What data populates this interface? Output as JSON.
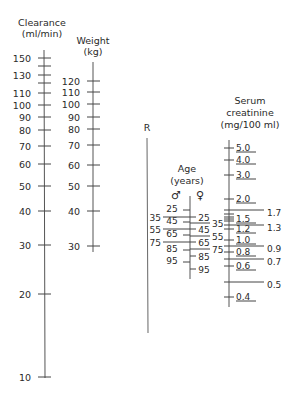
{
  "scales": {
    "clearance": {
      "title_line1": "Clearance",
      "title_line2": "(ml/min)",
      "labels": [
        {
          "v": "150",
          "y": 58
        },
        {
          "v": "130",
          "y": 75
        },
        {
          "v": "110",
          "y": 93
        },
        {
          "v": "100",
          "y": 105
        },
        {
          "v": "90",
          "y": 117
        },
        {
          "v": "80",
          "y": 130
        },
        {
          "v": "70",
          "y": 146
        },
        {
          "v": "60",
          "y": 164
        },
        {
          "v": "50",
          "y": 186
        },
        {
          "v": "40",
          "y": 211
        },
        {
          "v": "30",
          "y": 245
        },
        {
          "v": "20",
          "y": 294
        },
        {
          "v": "10",
          "y": 377
        }
      ],
      "minor_ticks_y": [
        66,
        83
      ]
    },
    "weight": {
      "title_line1": "Weight",
      "title_line2": "(kg)",
      "labels": [
        {
          "v": "120",
          "y": 81
        },
        {
          "v": "110",
          "y": 92
        },
        {
          "v": "100",
          "y": 104
        },
        {
          "v": "90",
          "y": 117
        },
        {
          "v": "80",
          "y": 129
        },
        {
          "v": "70",
          "y": 145
        },
        {
          "v": "60",
          "y": 165
        },
        {
          "v": "50",
          "y": 186
        },
        {
          "v": "40",
          "y": 211
        },
        {
          "v": "30",
          "y": 246
        }
      ]
    },
    "r_line": {
      "label": "R"
    },
    "age": {
      "title_line1": "Age",
      "title_line2": "(years)",
      "male_symbol": "♂",
      "female_symbol": "♀",
      "male_inner": [
        {
          "v": "25",
          "y": 210
        },
        {
          "v": "45",
          "y": 222
        },
        {
          "v": "65",
          "y": 235
        },
        {
          "v": "85",
          "y": 250
        },
        {
          "v": "95",
          "y": 262
        }
      ],
      "male_outer": [
        {
          "v": "35",
          "y": 217
        },
        {
          "v": "55",
          "y": 229
        },
        {
          "v": "75",
          "y": 242
        }
      ],
      "female_inner": [
        {
          "v": "25",
          "y": 217
        },
        {
          "v": "45",
          "y": 229
        },
        {
          "v": "65",
          "y": 242
        },
        {
          "v": "85",
          "y": 256
        },
        {
          "v": "95",
          "y": 269
        }
      ],
      "female_outer": [
        {
          "v": "35",
          "y": 223
        },
        {
          "v": "55",
          "y": 236
        },
        {
          "v": "75",
          "y": 249
        }
      ]
    },
    "creatinine": {
      "title_line1": "Serum",
      "title_line2": "creatinine",
      "title_line3": "(mg/100 ml)",
      "left_labels": [
        {
          "v": "5.0",
          "y": 148
        },
        {
          "v": "4.0",
          "y": 160
        },
        {
          "v": "3.0",
          "y": 175
        },
        {
          "v": "2.0",
          "y": 199
        },
        {
          "v": "1.5",
          "y": 219
        },
        {
          "v": "1.2",
          "y": 229
        },
        {
          "v": "1.0",
          "y": 240
        },
        {
          "v": "0.8",
          "y": 252
        },
        {
          "v": "0.6",
          "y": 266
        },
        {
          "v": "0.4",
          "y": 297
        }
      ],
      "right_labels": [
        {
          "v": "1.7",
          "y": 210
        },
        {
          "v": "1.3",
          "y": 225
        },
        {
          "v": "0.9",
          "y": 246
        },
        {
          "v": "0.7",
          "y": 259
        },
        {
          "v": "0.5",
          "y": 282
        }
      ]
    }
  }
}
